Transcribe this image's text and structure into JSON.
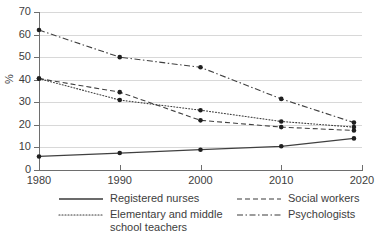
{
  "title_remnant": "",
  "axis": {
    "y_title": "%",
    "y_ticks": [
      0,
      10,
      20,
      30,
      40,
      50,
      60,
      70
    ],
    "x_ticks": [
      1980,
      1990,
      2000,
      2010,
      2020
    ]
  },
  "legend": {
    "items": [
      {
        "label": "Registered nurses",
        "label_line2": "",
        "style": "solid",
        "name": "registered-nurses"
      },
      {
        "label": "Social workers",
        "label_line2": "",
        "style": "dashed",
        "name": "social-workers"
      },
      {
        "label": "Elementary and middle",
        "label_line2": "school teachers",
        "style": "dotted",
        "name": "elementary-middle-school-teachers"
      },
      {
        "label": "Psychologists",
        "label_line2": "",
        "style": "dashdot",
        "name": "psychologists"
      }
    ]
  },
  "chart_data": {
    "type": "line",
    "title": "",
    "xlabel": "",
    "ylabel": "%",
    "x": [
      1980,
      1990,
      2000,
      2010,
      2019
    ],
    "xlim": [
      1980,
      2020
    ],
    "ylim": [
      0,
      70
    ],
    "ytick_step": 10,
    "grid": true,
    "legend_position": "bottom",
    "series": [
      {
        "name": "Registered nurses",
        "style": "solid",
        "color": "#404040",
        "values": [
          6,
          7.5,
          9,
          10.5,
          14
        ]
      },
      {
        "name": "Social workers",
        "style": "dashed",
        "color": "#404040",
        "values": [
          40.5,
          34.5,
          22,
          19,
          17.5
        ]
      },
      {
        "name": "Elementary and middle school teachers",
        "style": "dotted",
        "color": "#404040",
        "values": [
          40.5,
          31,
          26.5,
          21.5,
          19
        ]
      },
      {
        "name": "Psychologists",
        "style": "dashdot",
        "color": "#404040",
        "values": [
          62,
          50,
          45.5,
          31.5,
          21
        ]
      }
    ]
  }
}
